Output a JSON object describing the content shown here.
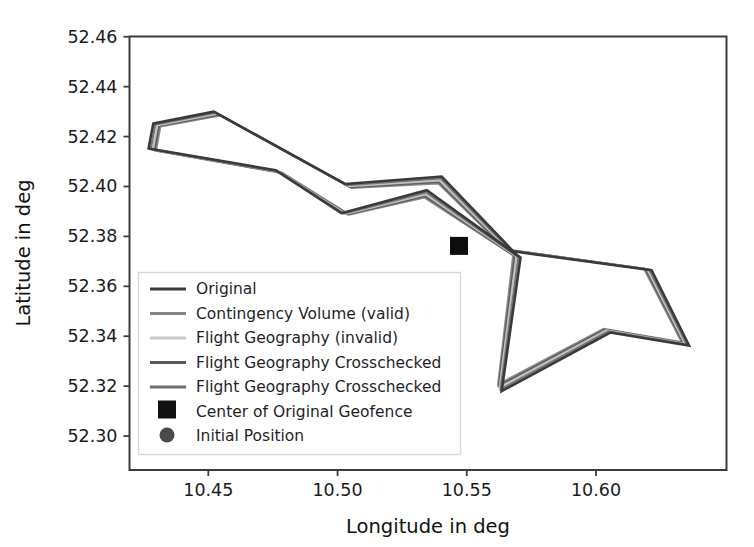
{
  "chart_data": {
    "type": "line",
    "title": "",
    "xlabel": "Longitude  in deg",
    "ylabel": "Latitude  in deg",
    "xlim": [
      10.4195,
      10.6505
    ],
    "ylim": [
      52.2864,
      52.4601
    ],
    "xticks": [
      10.45,
      10.5,
      10.55,
      10.6
    ],
    "xticklabels": [
      "10.45",
      "10.50",
      "10.55",
      "10.60"
    ],
    "yticks": [
      52.3,
      52.32,
      52.34,
      52.36,
      52.38,
      52.4,
      52.42,
      52.44,
      52.46
    ],
    "yticklabels": [
      "52.30",
      "52.32",
      "52.34",
      "52.36",
      "52.38",
      "52.40",
      "52.42",
      "52.44",
      "52.46"
    ],
    "grid": false,
    "legend_position": "center-left",
    "series": [
      {
        "name": "Original",
        "kind": "closed-polygon",
        "color": "#3a3a3a",
        "linewidth": 2.6,
        "points": [
          [
            10.4287,
            52.4252
          ],
          [
            10.4521,
            52.43
          ],
          [
            10.5029,
            52.401
          ],
          [
            10.5403,
            52.404
          ],
          [
            10.568,
            52.374
          ],
          [
            10.6215,
            52.3665
          ],
          [
            10.636,
            52.3363
          ],
          [
            10.6055,
            52.3415
          ],
          [
            10.5635,
            52.318
          ],
          [
            10.5708,
            52.3715
          ],
          [
            10.5345,
            52.3985
          ],
          [
            10.5015,
            52.3893
          ],
          [
            10.476,
            52.4065
          ],
          [
            10.4269,
            52.4152
          ]
        ]
      },
      {
        "name": "Contingency Volume (valid)",
        "kind": "closed-polygon",
        "color": "#787878",
        "linewidth": 2.2,
        "offset": 2.2
      },
      {
        "name": "Flight Geography (invalid)",
        "kind": "closed-polygon",
        "color": "#c2c2c2",
        "linewidth": 2.0,
        "offset": 4.4
      },
      {
        "name": "Flight Geography Crosschecked",
        "kind": "closed-polygon",
        "color": "#5e5e5e",
        "linewidth": 2.2,
        "offset": 6.0
      },
      {
        "name": "Flight Geography Crosschecked",
        "kind": "closed-polygon",
        "color": "#8a8a8a",
        "linewidth": 2.2,
        "offset": 7.6
      },
      {
        "name": "Center of Original Geofence",
        "kind": "marker-square",
        "color": "#0d0d0d",
        "points": [
          [
            10.547,
            52.3762
          ]
        ]
      },
      {
        "name": "Initial Position",
        "kind": "marker-circle",
        "color": "#4a4a4a",
        "points": []
      }
    ]
  },
  "legend": {
    "entries": [
      {
        "label": "Original",
        "marker": "line",
        "color": "#3a3a3a"
      },
      {
        "label": "Contingency Volume (valid)",
        "marker": "line",
        "color": "#858585"
      },
      {
        "label": "Flight Geography (invalid)",
        "marker": "line",
        "color": "#c9c9c9"
      },
      {
        "label": "Flight Geography Crosschecked",
        "marker": "line",
        "color": "#5a5a5a"
      },
      {
        "label": "Flight Geography Crosschecked",
        "marker": "line",
        "color": "#6e6e6e"
      },
      {
        "label": "Center of Original Geofence",
        "marker": "square",
        "color": "#111111"
      },
      {
        "label": "Initial Position",
        "marker": "circle",
        "color": "#4a4a4a"
      }
    ]
  },
  "axes": {
    "frame_color": "#3c3c3c",
    "background": "#ffffff"
  }
}
